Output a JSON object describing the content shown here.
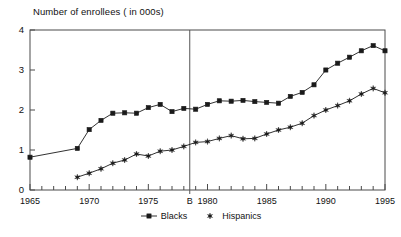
{
  "chart_data": {
    "type": "line",
    "title": "Number of enrollees ( in 000s)",
    "xlabel": "",
    "ylabel": "",
    "xlim": [
      1965,
      1995
    ],
    "ylim": [
      0,
      4
    ],
    "yticks": [
      "0",
      "1",
      "2",
      "3",
      "4"
    ],
    "ytick_values": [
      0,
      1,
      2,
      3,
      4
    ],
    "xticks": [
      "1965",
      "1970",
      "1975",
      "B",
      "1980",
      "1985",
      "1990",
      "1995"
    ],
    "xtick_values": [
      1965,
      1970,
      1975,
      1978.5,
      1980,
      1985,
      1990,
      1995
    ],
    "grid": false,
    "legend_position": "bottom-center",
    "annotations": [
      {
        "name": "break-line",
        "label": "B",
        "x": 1978.5,
        "type": "vertical-line"
      }
    ],
    "series": [
      {
        "name": "Blacks",
        "marker": "filled-square",
        "color": "#1a1a1a",
        "x": [
          1965,
          1969,
          1970,
          1971,
          1972,
          1973,
          1974,
          1975,
          1976,
          1977,
          1978,
          1979,
          1980,
          1981,
          1982,
          1983,
          1984,
          1985,
          1986,
          1987,
          1988,
          1989,
          1990,
          1991,
          1992,
          1993,
          1994,
          1995
        ],
        "values": [
          0.82,
          1.04,
          1.51,
          1.74,
          1.92,
          1.93,
          1.92,
          2.06,
          2.14,
          1.96,
          2.04,
          2.02,
          2.14,
          2.23,
          2.22,
          2.24,
          2.21,
          2.19,
          2.17,
          2.34,
          2.44,
          2.63,
          3.0,
          3.17,
          3.32,
          3.48,
          3.61,
          3.48
        ]
      },
      {
        "name": "Hispanics",
        "marker": "star",
        "color": "#1a1a1a",
        "x": [
          1969,
          1970,
          1971,
          1972,
          1973,
          1974,
          1975,
          1976,
          1977,
          1978,
          1979,
          1980,
          1981,
          1982,
          1983,
          1984,
          1985,
          1986,
          1987,
          1988,
          1989,
          1990,
          1991,
          1992,
          1993,
          1994,
          1995
        ],
        "values": [
          0.32,
          0.42,
          0.53,
          0.67,
          0.75,
          0.9,
          0.85,
          0.97,
          1.0,
          1.09,
          1.19,
          1.21,
          1.29,
          1.36,
          1.28,
          1.29,
          1.4,
          1.5,
          1.57,
          1.67,
          1.86,
          2.0,
          2.11,
          2.23,
          2.4,
          2.54,
          2.43
        ]
      }
    ],
    "legend": [
      {
        "label": "Blacks",
        "marker": "filled-square"
      },
      {
        "label": "Hispanics",
        "marker": "star"
      }
    ]
  }
}
